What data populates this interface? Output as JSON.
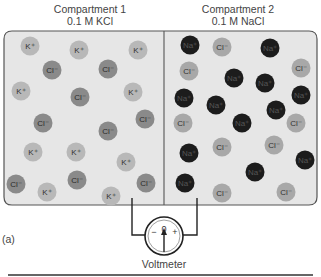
{
  "compartments": [
    {
      "title": "Compartment 1",
      "solution": "0.1 M KCl"
    },
    {
      "title": "Compartment 2",
      "solution": "0.1 M NaCl"
    }
  ],
  "ion_labels": {
    "K": "K⁺",
    "Na": "Na⁺",
    "Cl": "Cl⁻"
  },
  "colors": {
    "background": "#e6e6e6",
    "border": "#555555",
    "K": "#b8b8b8",
    "Cl_left": "#8a8a8a",
    "Cl_right": "#a8a8a8",
    "Na": "#1c1c1c"
  },
  "ions": {
    "left_K": [
      [
        30,
        46
      ],
      [
        79,
        50
      ],
      [
        138,
        50
      ],
      [
        21,
        91
      ],
      [
        133,
        92
      ],
      [
        33,
        152
      ],
      [
        76,
        152
      ],
      [
        126,
        162
      ],
      [
        47,
        192
      ],
      [
        111,
        196
      ]
    ],
    "left_Cl": [
      [
        52,
        70
      ],
      [
        108,
        69
      ],
      [
        80,
        97
      ],
      [
        43,
        123
      ],
      [
        145,
        119
      ],
      [
        108,
        131
      ],
      [
        16,
        184
      ],
      [
        77,
        180
      ],
      [
        146,
        183
      ]
    ],
    "right_Na": [
      [
        190,
        45
      ],
      [
        270,
        48
      ],
      [
        234,
        78
      ],
      [
        265,
        83
      ],
      [
        184,
        98
      ],
      [
        301,
        95
      ],
      [
        216,
        105
      ],
      [
        276,
        110
      ],
      [
        242,
        123
      ],
      [
        189,
        153
      ],
      [
        305,
        160
      ],
      [
        255,
        172
      ],
      [
        185,
        183
      ]
    ],
    "right_Cl": [
      [
        222,
        47
      ],
      [
        189,
        71
      ],
      [
        301,
        68
      ],
      [
        183,
        123
      ],
      [
        296,
        123
      ],
      [
        222,
        147
      ],
      [
        274,
        145
      ],
      [
        222,
        193
      ],
      [
        286,
        192
      ]
    ]
  },
  "voltmeter": {
    "label": "Voltmeter",
    "zero": "0",
    "minus": "−",
    "plus": "+"
  },
  "panel_label": "(a)"
}
